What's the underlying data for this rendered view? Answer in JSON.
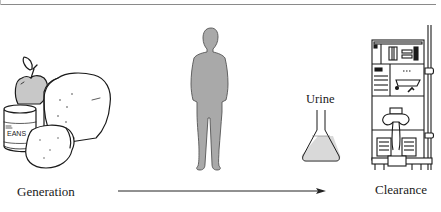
{
  "diagram": {
    "labels": {
      "generation": "Generation",
      "urine": "Urine",
      "clearance": "Clearance"
    },
    "can_label": "EANS",
    "icons": {
      "food": "food-icon",
      "person": "person-silhouette-icon",
      "flask": "flask-icon",
      "dialysis_machine": "dialysis-machine-icon",
      "arrow": "arrow-right-icon"
    },
    "colors": {
      "line": "#1a1a1a",
      "silhouette_fill": "#a9a9a9",
      "silhouette_stroke": "#555555",
      "liquid_fill": "#d9d9d9",
      "apple_fill": "#c8c8c8",
      "frame": "#8a8a8a"
    }
  }
}
